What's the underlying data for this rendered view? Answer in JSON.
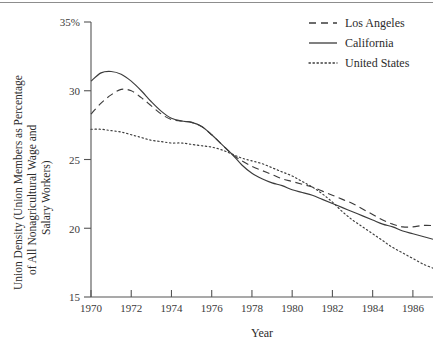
{
  "chart_data": {
    "type": "line",
    "title": "",
    "xlabel": "Year",
    "ylabel": "Union Density (Union Members as Percentage of All Nonagricultural Wage and Salary Workers)",
    "ylabel_line1": "Union Density (Union Members as Percentage",
    "ylabel_line2": "of All Nonagricultural Wage and",
    "ylabel_line3": "Salary Workers)",
    "xlim": [
      1970,
      1987
    ],
    "ylim": [
      15,
      35
    ],
    "grid": false,
    "legend_position": "top-right",
    "xticks": [
      1970,
      1972,
      1974,
      1976,
      1978,
      1980,
      1982,
      1984,
      1986
    ],
    "xtick_labels": [
      "1970",
      "1972",
      "1974",
      "1976",
      "1978",
      "1980",
      "1982",
      "1984",
      "1986"
    ],
    "yticks": [
      15,
      20,
      25,
      30,
      35
    ],
    "ytick_labels": [
      "15",
      "20",
      "25",
      "30",
      "35%"
    ],
    "x": [
      1970,
      1970.5,
      1971,
      1971.5,
      1972,
      1972.5,
      1973,
      1973.5,
      1974,
      1974.5,
      1975,
      1975.5,
      1976,
      1976.5,
      1977,
      1977.5,
      1978,
      1978.5,
      1979,
      1979.5,
      1980,
      1980.5,
      1981,
      1981.5,
      1982,
      1982.5,
      1983,
      1983.5,
      1984,
      1984.5,
      1985,
      1985.5,
      1986,
      1986.5,
      1987
    ],
    "series": [
      {
        "name": "Los Angeles",
        "style": "dashed",
        "color": "#3c3c3c",
        "values": [
          28.3,
          29.1,
          29.7,
          30.1,
          30.0,
          29.5,
          28.9,
          28.3,
          27.9,
          27.8,
          27.7,
          27.4,
          26.8,
          26.1,
          25.4,
          24.9,
          24.5,
          24.2,
          23.9,
          23.6,
          23.4,
          23.2,
          23.0,
          22.7,
          22.4,
          22.1,
          21.8,
          21.4,
          21.0,
          20.6,
          20.3,
          20.1,
          20.1,
          20.2,
          20.2
        ]
      },
      {
        "name": "California",
        "style": "solid",
        "color": "#3c3c3c",
        "values": [
          30.7,
          31.3,
          31.4,
          31.2,
          30.7,
          30.0,
          29.2,
          28.5,
          28.0,
          27.8,
          27.7,
          27.4,
          26.8,
          26.1,
          25.4,
          24.6,
          24.0,
          23.6,
          23.3,
          23.1,
          22.8,
          22.6,
          22.4,
          22.1,
          21.8,
          21.5,
          21.2,
          20.9,
          20.6,
          20.3,
          20.1,
          19.8,
          19.6,
          19.4,
          19.2
        ]
      },
      {
        "name": "United States",
        "style": "dotted",
        "color": "#3c3c3c",
        "values": [
          27.2,
          27.2,
          27.1,
          27.0,
          26.8,
          26.6,
          26.4,
          26.3,
          26.2,
          26.2,
          26.1,
          26.0,
          25.9,
          25.7,
          25.4,
          25.1,
          24.9,
          24.7,
          24.4,
          24.1,
          23.8,
          23.4,
          23.0,
          22.5,
          21.9,
          21.2,
          20.6,
          20.1,
          19.6,
          19.1,
          18.6,
          18.2,
          17.8,
          17.4,
          17.1
        ]
      }
    ]
  },
  "legend": {
    "entries": [
      {
        "label": "Los Angeles"
      },
      {
        "label": "California"
      },
      {
        "label": "United States"
      }
    ]
  }
}
